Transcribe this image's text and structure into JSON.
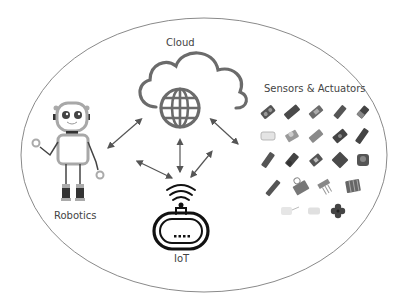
{
  "diagram": {
    "title": "",
    "nodes": {
      "cloud": {
        "label": "Cloud",
        "icon": "cloud-globe-icon"
      },
      "robotics": {
        "label": "Robotics",
        "icon": "robot-icon"
      },
      "sensors": {
        "label": "Sensors & Actuators",
        "icon": "sensor-modules-icon"
      },
      "iot": {
        "label": "IoT",
        "icon": "wifi-router-icon"
      }
    },
    "edges": [
      {
        "from": "cloud",
        "to": "robotics",
        "direction": "bidirectional"
      },
      {
        "from": "cloud",
        "to": "sensors",
        "direction": "bidirectional"
      },
      {
        "from": "cloud",
        "to": "iot",
        "direction": "bidirectional"
      },
      {
        "from": "robotics",
        "to": "iot",
        "direction": "bidirectional"
      },
      {
        "from": "sensors",
        "to": "iot",
        "direction": "bidirectional"
      }
    ],
    "colors": {
      "outline": "#888888",
      "icon_gray": "#6b6b6b",
      "arrow": "#555555",
      "iot_icon": "#111111",
      "robot_body": "#a8a8a8",
      "robot_dark": "#333333"
    }
  }
}
